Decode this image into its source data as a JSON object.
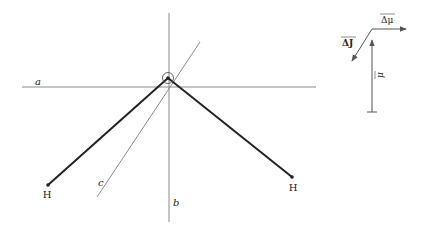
{
  "figure": {
    "colors": {
      "background": "#ffffff",
      "bond": "#222222",
      "axis": "#8a8a8a",
      "vector": "#555555"
    }
  },
  "axes": [
    {
      "id": "a",
      "label": "a",
      "x1": 22,
      "y1": 87,
      "x2": 316,
      "y2": 87,
      "label_x": 35,
      "label_y": 85
    },
    {
      "id": "b",
      "label": "b",
      "x1": 169,
      "y1": 13,
      "x2": 169,
      "y2": 222,
      "label_x": 173,
      "label_y": 206
    },
    {
      "id": "c",
      "label": "c",
      "x1": 200,
      "y1": 42,
      "x2": 97,
      "y2": 197,
      "label_x": 98,
      "label_y": 186
    }
  ],
  "atoms": {
    "oxygen": {
      "x": 168,
      "y": 78,
      "circle_r": 5.5
    },
    "hydrogens": [
      {
        "label": "H",
        "x": 48,
        "y": 185,
        "label_x": 47,
        "label_y": 198
      },
      {
        "label": "H",
        "x": 292,
        "y": 177,
        "label_x": 293,
        "label_y": 191
      }
    ]
  },
  "vectors": {
    "mu": {
      "label": "μ",
      "x": 372,
      "y_start": 112,
      "y_end": 40,
      "label_x": 380,
      "label_y": 75
    },
    "delta_mu": {
      "label": "Δμ",
      "x1": 372,
      "y1": 29,
      "x2": 406,
      "y2": 29,
      "label_x": 381,
      "label_y": 23
    },
    "delta_J": {
      "label": "ΔJ",
      "x1": 372,
      "y1": 29,
      "x2": 352,
      "y2": 61,
      "label_x": 342,
      "label_y": 46
    }
  }
}
